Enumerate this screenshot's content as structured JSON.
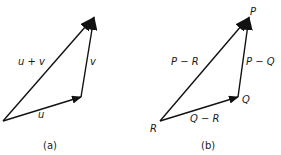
{
  "diagram_a": {
    "caption": "(a)",
    "labels": {
      "sum": "u + v",
      "v": "v",
      "u": "u"
    },
    "points": {
      "origin": [
        3,
        121
      ],
      "u_end": [
        81,
        97
      ],
      "v_end": [
        94,
        17
      ]
    }
  },
  "diagram_b": {
    "caption": "(b)",
    "labels": {
      "P": "P",
      "Q": "Q",
      "R": "R",
      "P_minus_R": "P − R",
      "P_minus_Q": "P − Q",
      "Q_minus_R": "Q − R"
    },
    "points": {
      "R": [
        160,
        121
      ],
      "Q": [
        238,
        97
      ],
      "P": [
        249,
        17
      ]
    }
  },
  "colors": {
    "stroke": "#111111",
    "background": "#ffffff"
  }
}
